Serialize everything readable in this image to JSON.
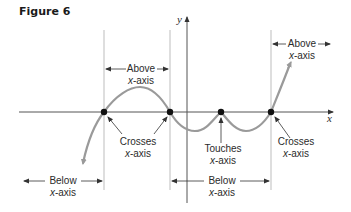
{
  "figure": {
    "title": "Figure 6",
    "axes": {
      "x_label": "x",
      "y_label": "y"
    },
    "region_labels": [
      {
        "id": "above-1",
        "line1": "Above",
        "line2_var": "x",
        "line2_rest": "-axis"
      },
      {
        "id": "above-2",
        "line1": "Above",
        "line2_var": "x",
        "line2_rest": "-axis"
      },
      {
        "id": "below-1",
        "line1": "Below",
        "line2_var": "x",
        "line2_rest": "-axis"
      },
      {
        "id": "below-2",
        "line1": "Below",
        "line2_var": "x",
        "line2_rest": "-axis"
      }
    ],
    "point_labels": [
      {
        "id": "crosses-1",
        "line1": "Crosses",
        "line2_var": "x",
        "line2_rest": "-axis"
      },
      {
        "id": "touches",
        "line1": "Touches",
        "line2_var": "x",
        "line2_rest": "-axis"
      },
      {
        "id": "crosses-2",
        "line1": "Crosses",
        "line2_var": "x",
        "line2_rest": "-axis"
      }
    ],
    "colors": {
      "curve": "#9a9a9a",
      "axis": "#555555",
      "guide": "#b5b5b5",
      "dot": "#111111",
      "text": "#2b2b2b"
    }
  }
}
